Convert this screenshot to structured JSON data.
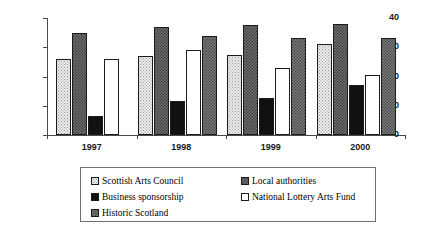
{
  "chart_data": {
    "type": "bar",
    "title": "",
    "subtitle": "",
    "xlabel": "",
    "ylabel": "",
    "categories": [
      "1997",
      "1998",
      "1999",
      "2000"
    ],
    "ylim": [
      0,
      40
    ],
    "yticks": [
      0,
      10,
      20,
      30,
      40
    ],
    "ytick_labels": [
      "0",
      "10",
      "20",
      "30",
      "40"
    ],
    "grid": false,
    "legend_position": "bottom",
    "series": [
      {
        "name": "Scottish Arts Council",
        "fill": "light-dotted",
        "color": "#ececec",
        "values": [
          26,
          27,
          27.5,
          31
        ]
      },
      {
        "name": "Local authorities",
        "fill": "dark-checker",
        "color": "#6d6d6d",
        "values": [
          35,
          37,
          37.5,
          38
        ]
      },
      {
        "name": "Business sponsorship",
        "fill": "solid-black",
        "color": "#111111",
        "values": [
          6.5,
          11.5,
          12.5,
          17
        ]
      },
      {
        "name": "National Lottery Arts Fund",
        "fill": "white",
        "color": "#ffffff",
        "values": [
          26,
          29,
          23,
          20.5
        ]
      },
      {
        "name": "Historic Scotland",
        "fill": "mid-checker",
        "color": "#787878",
        "values": [
          null,
          34,
          33,
          33
        ]
      }
    ]
  },
  "legend": {
    "left_column": [
      {
        "label": "Scottish Arts Council",
        "swatch": "light-dotted"
      },
      {
        "label": "Business sponsorship",
        "swatch": "solid-black"
      },
      {
        "label": "Historic Scotland",
        "swatch": "mid-checker"
      }
    ],
    "right_column": [
      {
        "label": "Local authorities",
        "swatch": "dark-checker"
      },
      {
        "label": "National Lottery Arts Fund",
        "swatch": "white"
      }
    ]
  }
}
